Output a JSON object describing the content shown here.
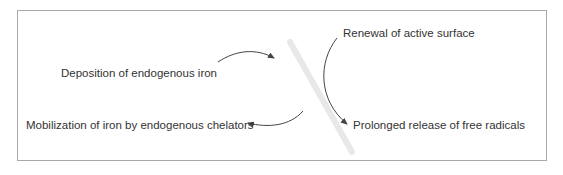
{
  "diagram": {
    "type": "cycle-flow",
    "nodes": [
      {
        "id": "deposition",
        "label": "Deposition of endogenous iron"
      },
      {
        "id": "mobilization",
        "label": "Mobilization of iron by endogenous chelators"
      },
      {
        "id": "renewal",
        "label": "Renewal of active surface"
      },
      {
        "id": "release",
        "label": "Prolonged release of free radicals"
      }
    ],
    "edges": [
      {
        "from": "deposition",
        "to": "center",
        "style": "curved-arrow"
      },
      {
        "from": "center",
        "to": "mobilization",
        "style": "curved-arrow"
      },
      {
        "from": "renewal",
        "to": "release",
        "style": "curved-arrow"
      }
    ],
    "colors": {
      "text": "#333333",
      "arrow": "#444444",
      "frame": "#a9a9a9",
      "watermark": "#e6e6e6"
    }
  }
}
